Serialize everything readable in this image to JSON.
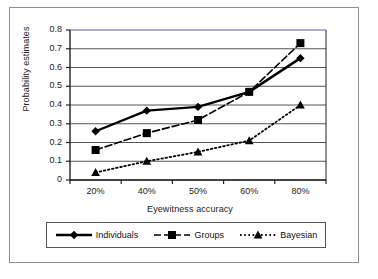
{
  "chart_data": {
    "type": "line",
    "title": "",
    "xlabel": "Eyewitness accuracy",
    "ylabel": "Probability estimates",
    "categories": [
      "20%",
      "40%",
      "50%",
      "60%",
      "80%"
    ],
    "ylim": [
      0,
      0.8
    ],
    "ytick_labels": [
      "0.8",
      "0.7",
      "0.6",
      "0.5",
      "0.4",
      "0.3",
      "0.2",
      "0.1",
      "0"
    ],
    "ytick_values": [
      0.8,
      0.7,
      0.6,
      0.5,
      0.4,
      0.3,
      0.2,
      0.1,
      0
    ],
    "grid": "horizontal",
    "legend_position": "bottom",
    "series": [
      {
        "name": "Individuals",
        "values": [
          0.26,
          0.37,
          0.39,
          0.47,
          0.65
        ],
        "marker": "diamond",
        "line_style": "solid",
        "color": "#000000"
      },
      {
        "name": "Groups",
        "values": [
          0.16,
          0.25,
          0.32,
          0.47,
          0.73
        ],
        "marker": "square",
        "line_style": "dashed",
        "color": "#000000"
      },
      {
        "name": "Bayesian",
        "values": [
          0.04,
          0.1,
          0.15,
          0.21,
          0.4
        ],
        "marker": "triangle",
        "line_style": "dotted",
        "color": "#000000"
      }
    ]
  },
  "figure": {
    "plot_top_border_color": "#5a5aa0",
    "frame_color": "#8d8d8d",
    "gridline_color": "#555555",
    "background": "#ffffff"
  }
}
